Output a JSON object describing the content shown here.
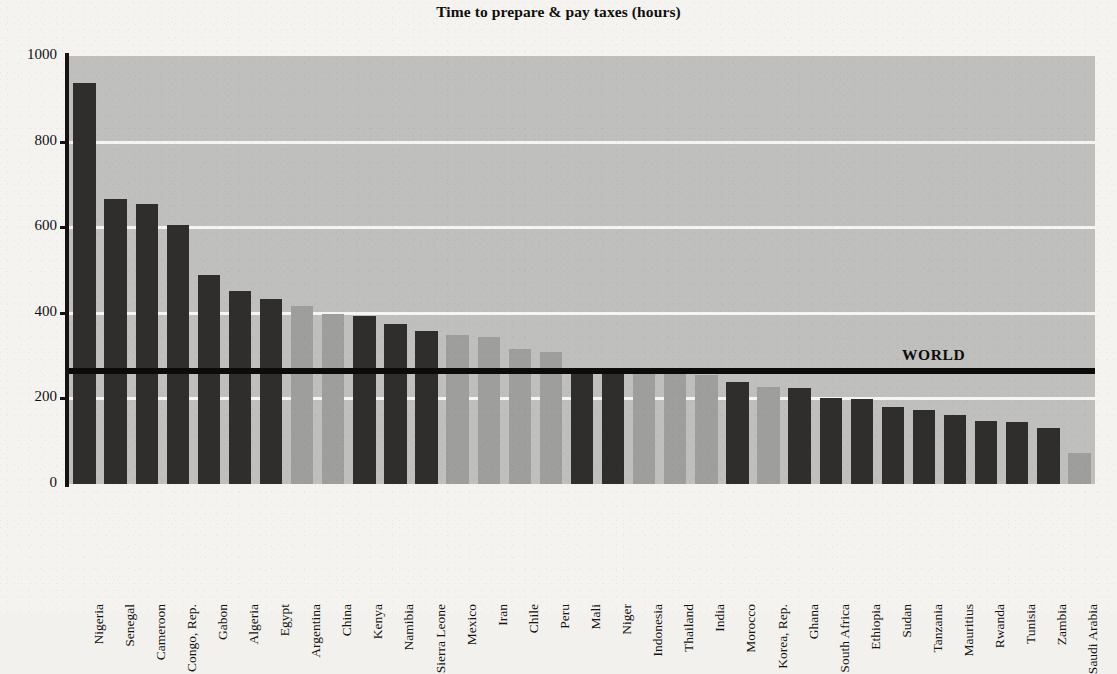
{
  "chart_data": {
    "type": "bar",
    "title": "Time to prepare & pay taxes (hours)",
    "xlabel": "",
    "ylabel": "",
    "ylim": [
      0,
      1000
    ],
    "yticks": [
      0,
      200,
      400,
      600,
      800,
      1000
    ],
    "grid": true,
    "gridlines_at": [
      200,
      400,
      600,
      800
    ],
    "legend": null,
    "categories": [
      "Nigeria",
      "Senegal",
      "Cameroon",
      "Congo, Rep.",
      "Gabon",
      "Algeria",
      "Egypt",
      "Argentina",
      "China",
      "Kenya",
      "Namibia",
      "Sierra Leone",
      "Mexico",
      "Iran",
      "Chile",
      "Peru",
      "Mali",
      "Niger",
      "Indonesia",
      "Thailand",
      "India",
      "Morocco",
      "Korea, Rep.",
      "Ghana",
      "South Africa",
      "Ethiopia",
      "Sudan",
      "Tanzania",
      "Mauritius",
      "Rwanda",
      "Tunisia",
      "Zambia",
      "Saudi Arabia"
    ],
    "values": [
      938,
      666,
      654,
      606,
      488,
      451,
      433,
      415,
      398,
      392,
      375,
      357,
      347,
      344,
      316,
      309,
      270,
      270,
      266,
      264,
      254,
      238,
      226,
      224,
      200,
      198,
      180,
      172,
      161,
      148,
      144,
      132,
      72
    ],
    "bar_shades": [
      "dark",
      "dark",
      "dark",
      "dark",
      "dark",
      "dark",
      "dark",
      "light",
      "light",
      "dark",
      "dark",
      "dark",
      "light",
      "light",
      "light",
      "light",
      "dark",
      "dark",
      "light",
      "light",
      "light",
      "dark",
      "light",
      "dark",
      "dark",
      "dark",
      "dark",
      "dark",
      "dark",
      "dark",
      "dark",
      "dark",
      "light"
    ],
    "reference_line": {
      "label": "WORLD",
      "value": 265
    },
    "colors": {
      "bar_dark": "#2f2e2c",
      "bar_light": "#9e9e9c",
      "plot_background": "#bfbfbd",
      "gridline": "#f6f5f2",
      "reference_line": "#0c0b0a",
      "axis": "#141312",
      "page_background": "#f4f3f0",
      "text": "#111111"
    }
  }
}
